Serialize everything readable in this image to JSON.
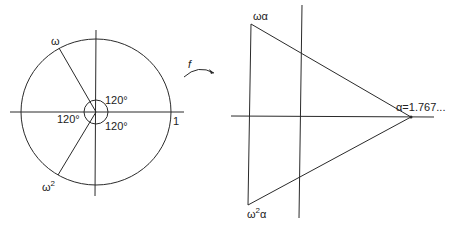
{
  "left_figure": {
    "labels": {
      "omega": "ω",
      "omega_sq_base": "ω",
      "omega_sq_exp": "2",
      "one": "1",
      "angle_top": "120°",
      "angle_left": "120°",
      "angle_bottom": "120°"
    }
  },
  "map_arrow": {
    "label": "f"
  },
  "right_figure": {
    "labels": {
      "omega_alpha": "ωα",
      "omega_sq_alpha_base": "ω",
      "omega_sq_alpha_exp": "2",
      "omega_sq_alpha_tail": "α",
      "alpha_value": "α=1.767..."
    }
  },
  "colors": {
    "line": "#2a2a2a",
    "text": "#222222",
    "background": "#ffffff"
  }
}
